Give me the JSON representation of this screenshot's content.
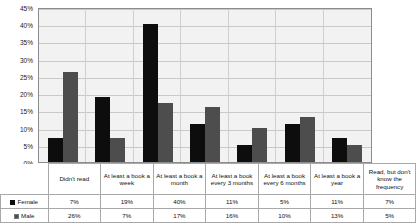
{
  "chart_data": {
    "type": "bar",
    "title": "",
    "xlabel": "",
    "ylabel": "",
    "ylim": [
      0,
      45
    ],
    "ytick_labels": [
      "45%",
      "40%",
      "35%",
      "30%",
      "25%",
      "20%",
      "15%",
      "10%",
      "5%",
      "0%"
    ],
    "ytick_values": [
      45,
      40,
      35,
      30,
      25,
      20,
      15,
      10,
      5,
      0
    ],
    "grid": true,
    "legend_position": "table-left",
    "categories": [
      "Didn't read",
      "At least a book a week",
      "At least a book a month",
      "At least a book every 3 months",
      "At least a book every 6 months",
      "At least a book a year",
      "Read, but don't know the frequency"
    ],
    "series": [
      {
        "name": "Female",
        "color": "#0d0d0d",
        "values": [
          7,
          19,
          40,
          11,
          5,
          11,
          7
        ],
        "labels": [
          "7%",
          "19%",
          "40%",
          "11%",
          "5%",
          "11%",
          "7%"
        ]
      },
      {
        "name": "Male",
        "color": "#4d4d4d",
        "values": [
          26,
          7,
          17,
          16,
          10,
          13,
          5
        ],
        "labels": [
          "26%",
          "7%",
          "17%",
          "16%",
          "10%",
          "13%",
          "5%"
        ]
      }
    ]
  },
  "table": {
    "header_labels": [
      "Didn't read",
      "At least a book a week",
      "At least a book a month",
      "At least a book every 3 months",
      "At least a book every 6 months",
      "At least a book a year",
      "Read, but don't know the frequency"
    ],
    "rows": [
      {
        "label": "Female",
        "swatch_color": "#0d0d0d",
        "cells": [
          "7%",
          "19%",
          "40%",
          "11%",
          "5%",
          "11%",
          "7%"
        ]
      },
      {
        "label": "Male",
        "swatch_color": "#4d4d4d",
        "cells": [
          "26%",
          "7%",
          "17%",
          "16%",
          "10%",
          "13%",
          "5%"
        ]
      }
    ]
  }
}
